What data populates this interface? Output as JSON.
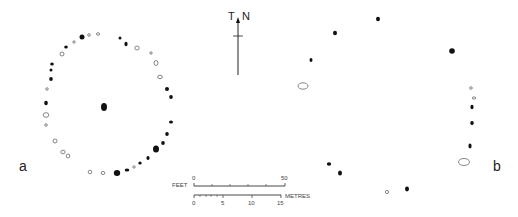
{
  "figure": {
    "panel_a_label": "a",
    "panel_b_label": "b",
    "north_arrow": {
      "label_left": "T",
      "label_right": "N"
    },
    "scale_bar": {
      "feet_label": "FEET",
      "feet_ticks": [
        "0",
        "50"
      ],
      "metres_label": "METRES",
      "metres_ticks": [
        "0",
        "5",
        "10",
        "15"
      ]
    },
    "colors": {
      "ink": "#111111",
      "outline": "#555555",
      "background": "#ffffff"
    }
  },
  "panel_a": {
    "description": "stone circle plan with central stone",
    "centre_stone": {
      "x": 104,
      "y": 107,
      "type": "filled",
      "rx": 3,
      "ry": 4
    },
    "stones": [
      {
        "x": 82,
        "y": 37,
        "type": "filled",
        "rx": 2.5,
        "ry": 2.5
      },
      {
        "x": 89,
        "y": 35,
        "type": "open",
        "rx": 1.3,
        "ry": 1.3
      },
      {
        "x": 98,
        "y": 34,
        "type": "open",
        "rx": 1.5,
        "ry": 1.3
      },
      {
        "x": 120,
        "y": 38,
        "type": "filled",
        "rx": 1.5,
        "ry": 1.5
      },
      {
        "x": 126,
        "y": 44,
        "type": "filled",
        "rx": 1.6,
        "ry": 2.2
      },
      {
        "x": 137,
        "y": 48,
        "type": "open",
        "rx": 2.2,
        "ry": 2
      },
      {
        "x": 151,
        "y": 53,
        "type": "open",
        "rx": 1.2,
        "ry": 1.2
      },
      {
        "x": 156,
        "y": 63,
        "type": "open",
        "rx": 2,
        "ry": 2.5
      },
      {
        "x": 160,
        "y": 77,
        "type": "open",
        "rx": 2.4,
        "ry": 1.7
      },
      {
        "x": 167,
        "y": 89,
        "type": "filled",
        "rx": 2,
        "ry": 2
      },
      {
        "x": 171,
        "y": 97,
        "type": "filled",
        "rx": 1.8,
        "ry": 2
      },
      {
        "x": 171,
        "y": 122,
        "type": "filled",
        "rx": 2,
        "ry": 1.6
      },
      {
        "x": 167,
        "y": 134,
        "type": "filled",
        "rx": 1.8,
        "ry": 2
      },
      {
        "x": 163,
        "y": 143,
        "type": "filled",
        "rx": 1.8,
        "ry": 2
      },
      {
        "x": 156,
        "y": 149,
        "type": "filled",
        "rx": 3,
        "ry": 3.5
      },
      {
        "x": 148,
        "y": 158,
        "type": "filled",
        "rx": 1.6,
        "ry": 2
      },
      {
        "x": 140,
        "y": 163,
        "type": "filled",
        "rx": 1.7,
        "ry": 1.5
      },
      {
        "x": 134,
        "y": 167,
        "type": "open",
        "rx": 1.2,
        "ry": 1.2
      },
      {
        "x": 127,
        "y": 170,
        "type": "filled",
        "rx": 2.3,
        "ry": 1.6
      },
      {
        "x": 117,
        "y": 173,
        "type": "filled",
        "rx": 3.2,
        "ry": 3
      },
      {
        "x": 103,
        "y": 173,
        "type": "open",
        "rx": 1.8,
        "ry": 1.6
      },
      {
        "x": 90,
        "y": 172,
        "type": "open",
        "rx": 1.8,
        "ry": 1.8
      },
      {
        "x": 68,
        "y": 156,
        "type": "open",
        "rx": 1.8,
        "ry": 2
      },
      {
        "x": 63,
        "y": 152,
        "type": "open",
        "rx": 2.2,
        "ry": 1.8
      },
      {
        "x": 55,
        "y": 141,
        "type": "open",
        "rx": 2,
        "ry": 2
      },
      {
        "x": 46,
        "y": 125,
        "type": "open",
        "rx": 1.3,
        "ry": 1.3
      },
      {
        "x": 46,
        "y": 115,
        "type": "open",
        "rx": 2.8,
        "ry": 2.3
      },
      {
        "x": 46,
        "y": 103,
        "type": "filled",
        "rx": 1.8,
        "ry": 2.2
      },
      {
        "x": 47,
        "y": 89,
        "type": "open",
        "rx": 1.3,
        "ry": 1.2
      },
      {
        "x": 51,
        "y": 79,
        "type": "filled",
        "rx": 1.8,
        "ry": 2
      },
      {
        "x": 51,
        "y": 70,
        "type": "filled",
        "rx": 1.5,
        "ry": 1.6
      },
      {
        "x": 52,
        "y": 64,
        "type": "filled",
        "rx": 1.8,
        "ry": 1.6
      },
      {
        "x": 62,
        "y": 54,
        "type": "open",
        "rx": 2,
        "ry": 2
      },
      {
        "x": 66,
        "y": 47,
        "type": "filled",
        "rx": 1.8,
        "ry": 1.5
      },
      {
        "x": 74,
        "y": 42,
        "type": "open",
        "rx": 1.2,
        "ry": 1.2
      }
    ]
  },
  "panel_b": {
    "description": "stone circle plan, larger diameter",
    "stones": [
      {
        "x": 378,
        "y": 19,
        "type": "filled",
        "rx": 2,
        "ry": 2.2
      },
      {
        "x": 335,
        "y": 33,
        "type": "filled",
        "rx": 2,
        "ry": 2.3
      },
      {
        "x": 311,
        "y": 60,
        "type": "filled",
        "rx": 1.5,
        "ry": 2
      },
      {
        "x": 303,
        "y": 86,
        "type": "open",
        "rx": 5,
        "ry": 3.2
      },
      {
        "x": 452,
        "y": 51,
        "type": "filled",
        "rx": 2.8,
        "ry": 2.8
      },
      {
        "x": 471,
        "y": 88,
        "type": "open",
        "rx": 1.3,
        "ry": 1.3
      },
      {
        "x": 474,
        "y": 98,
        "type": "open",
        "rx": 1.8,
        "ry": 1.1
      },
      {
        "x": 472,
        "y": 107,
        "type": "filled",
        "rx": 1.6,
        "ry": 2.2
      },
      {
        "x": 472,
        "y": 123,
        "type": "filled",
        "rx": 1.8,
        "ry": 2
      },
      {
        "x": 470,
        "y": 146,
        "type": "filled",
        "rx": 1.6,
        "ry": 2.4
      },
      {
        "x": 464,
        "y": 162,
        "type": "open",
        "rx": 5.5,
        "ry": 3.5
      },
      {
        "x": 329,
        "y": 164,
        "type": "filled",
        "rx": 2.2,
        "ry": 1.8
      },
      {
        "x": 340,
        "y": 173,
        "type": "filled",
        "rx": 2,
        "ry": 2.6
      },
      {
        "x": 387,
        "y": 192,
        "type": "open",
        "rx": 1.7,
        "ry": 1.6
      },
      {
        "x": 407,
        "y": 189,
        "type": "filled",
        "rx": 2,
        "ry": 2.4
      }
    ]
  }
}
